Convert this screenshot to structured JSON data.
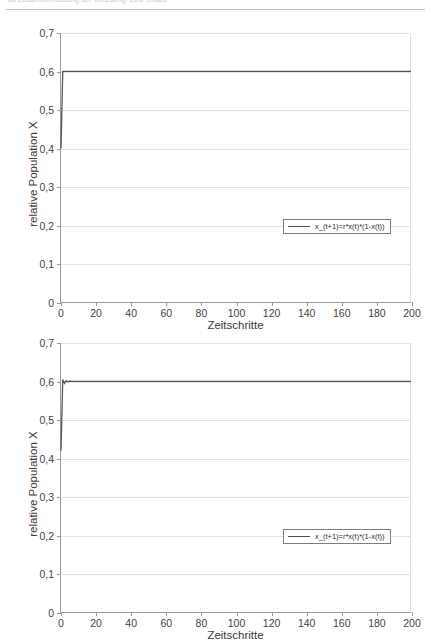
{
  "document": {
    "header_text": "bb    Zusammenfassung der Vorlesung: Eine Chaos",
    "header_rule": true
  },
  "figures": [
    {
      "name": "logistic-map-chart-1",
      "legend_label": "x_(t+1)=r*x(t)*(1-x(t))",
      "legend_icon": "line-swatch"
    },
    {
      "name": "logistic-map-chart-2",
      "legend_label": "x_(t+1)=r*x(t)*(1-x(t))",
      "legend_icon": "line-swatch"
    }
  ],
  "chart_data": [
    {
      "type": "line",
      "title": "",
      "xlabel": "Zeitschritte",
      "ylabel": "relative Population X",
      "xlim": [
        0,
        200
      ],
      "ylim": [
        0,
        0.7
      ],
      "xticks": [
        0,
        20,
        40,
        60,
        80,
        100,
        120,
        140,
        160,
        180,
        200
      ],
      "xticklabels": [
        "0",
        "20",
        "40",
        "60",
        "80",
        "100",
        "120",
        "140",
        "160",
        "180",
        "200"
      ],
      "yticks": [
        0,
        0.1,
        0.2,
        0.3,
        0.4,
        0.5,
        0.6,
        0.7
      ],
      "yticklabels": [
        "0",
        "0,1",
        "0,2",
        "0,3",
        "0,4",
        "0,5",
        "0,6",
        "0,7"
      ],
      "grid": true,
      "legend": [
        "x_(t+1)=r*x(t)*(1-x(t))"
      ],
      "legend_position": "lower right",
      "line_color": "#555555",
      "series": [
        {
          "name": "x_(t+1)=r*x(t)*(1-x(t))",
          "x": [
            0,
            1,
            2,
            3,
            4,
            6,
            10,
            20,
            40,
            60,
            80,
            100,
            120,
            140,
            160,
            180,
            200
          ],
          "values": [
            0.4,
            0.6,
            0.6,
            0.6,
            0.6,
            0.6,
            0.6,
            0.6,
            0.6,
            0.6,
            0.6,
            0.6,
            0.6,
            0.6,
            0.6,
            0.6,
            0.6
          ]
        }
      ]
    },
    {
      "type": "line",
      "title": "",
      "xlabel": "Zeitschritte",
      "ylabel": "relative Population X",
      "xlim": [
        0,
        200
      ],
      "ylim": [
        0,
        0.7
      ],
      "xticks": [
        0,
        20,
        40,
        60,
        80,
        100,
        120,
        140,
        160,
        180,
        200
      ],
      "xticklabels": [
        "0",
        "20",
        "40",
        "60",
        "80",
        "100",
        "120",
        "140",
        "160",
        "180",
        "200"
      ],
      "yticks": [
        0,
        0.1,
        0.2,
        0.3,
        0.4,
        0.5,
        0.6,
        0.7
      ],
      "yticklabels": [
        "0",
        "0,1",
        "0,2",
        "0,3",
        "0,4",
        "0,5",
        "0,6",
        "0,7"
      ],
      "grid": true,
      "legend": [
        "x_(t+1)=r*x(t)*(1-x(t))"
      ],
      "legend_position": "lower right",
      "line_color": "#555555",
      "series": [
        {
          "name": "x_(t+1)=r*x(t)*(1-x(t))",
          "x": [
            0,
            1,
            2,
            3,
            4,
            5,
            6,
            8,
            10,
            20,
            40,
            60,
            80,
            100,
            120,
            140,
            160,
            180,
            200
          ],
          "values": [
            0.42,
            0.605,
            0.595,
            0.602,
            0.599,
            0.601,
            0.6,
            0.6,
            0.6,
            0.6,
            0.6,
            0.6,
            0.6,
            0.6,
            0.6,
            0.6,
            0.6,
            0.6,
            0.6
          ]
        }
      ]
    }
  ]
}
